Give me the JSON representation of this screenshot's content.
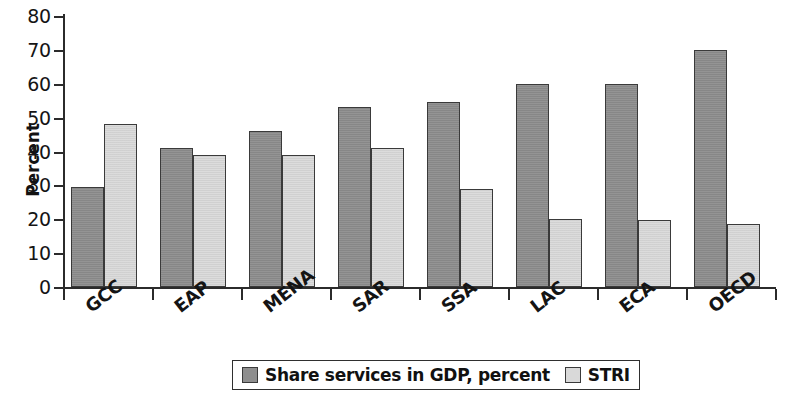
{
  "chart_data": {
    "type": "bar",
    "title": "",
    "xlabel": "",
    "ylabel": "Percent",
    "ylim": [
      0,
      80
    ],
    "ytick_step": 10,
    "yticks": [
      0,
      10,
      20,
      30,
      40,
      50,
      60,
      70,
      80
    ],
    "grid": false,
    "legend_position": "bottom",
    "categories": [
      "GCC",
      "EAP",
      "MENA",
      "SAR",
      "SSA",
      "LAC",
      "ECA",
      "OECD"
    ],
    "series": [
      {
        "name": "Share services in GDP, percent",
        "color": "#8e8e8e",
        "values": [
          29.5,
          41,
          46,
          53,
          54.5,
          60,
          60,
          70
        ]
      },
      {
        "name": "STRI",
        "color": "#d9d9d9",
        "values": [
          48,
          39,
          39,
          41,
          29,
          20,
          19.7,
          18.5
        ]
      }
    ]
  },
  "legend": {
    "items": [
      {
        "label": "Share services in GDP, percent",
        "swatch": "dark"
      },
      {
        "label": "STRI",
        "swatch": "light"
      }
    ]
  },
  "colors": {
    "series_dark": "#8e8e8e",
    "series_light": "#d9d9d9",
    "axis": "#2b2b2b",
    "outline": "#3a3a3a",
    "background": "#ffffff"
  }
}
